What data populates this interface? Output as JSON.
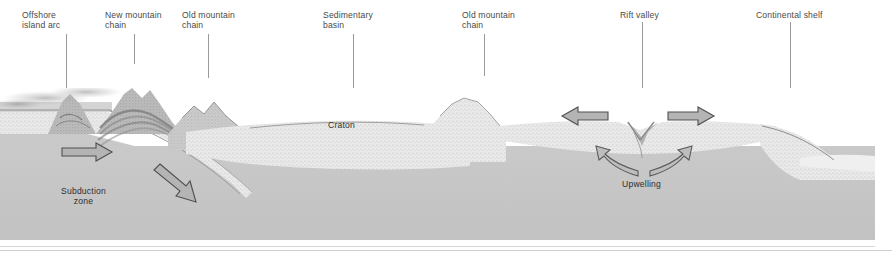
{
  "diagram": {
    "type": "cross-section",
    "colors": {
      "mantle": "#c6c6c6",
      "crust": "#e8e8e8",
      "mountain": "#b8b8b8",
      "ocean": "#d9d9d9",
      "label_text": "#4a4a4a",
      "leader_line": "#9a9a9a",
      "arrow_fill": "#b4b4b4",
      "arrow_stroke": "#4f4f4f"
    }
  },
  "callouts": [
    {
      "id": "offshore-island-arc",
      "line1": "Offshore",
      "line2": "island arc",
      "text_x": 22,
      "text_y": 10,
      "leader_x": 66,
      "leader_y": 34,
      "leader_h": 66
    },
    {
      "id": "new-mountain-chain",
      "line1": "New mountain",
      "line2": "chain",
      "text_x": 105,
      "text_y": 10,
      "leader_x": 134,
      "leader_y": 34,
      "leader_h": 30
    },
    {
      "id": "old-mountain-chain-left",
      "line1": "Old mountain",
      "line2": "chain",
      "text_x": 182,
      "text_y": 10,
      "leader_x": 208,
      "leader_y": 34,
      "leader_h": 44
    },
    {
      "id": "sedimentary-basin",
      "line1": "Sedimentary",
      "line2": "basin",
      "text_x": 323,
      "text_y": 10,
      "leader_x": 353,
      "leader_y": 34,
      "leader_h": 64
    },
    {
      "id": "old-mountain-chain-right",
      "line1": "Old mountain",
      "line2": "chain",
      "text_x": 462,
      "text_y": 10,
      "leader_x": 484,
      "leader_y": 34,
      "leader_h": 42
    },
    {
      "id": "rift-valley",
      "line1": "Rift valley",
      "line2": "",
      "text_x": 620,
      "text_y": 10,
      "leader_x": 642,
      "leader_y": 22,
      "leader_h": 76
    },
    {
      "id": "continental-shelf",
      "line1": "Continental shelf",
      "line2": "",
      "text_x": 756,
      "text_y": 10,
      "leader_x": 790,
      "leader_y": 22,
      "leader_h": 76
    }
  ],
  "inline_labels": [
    {
      "id": "subduction-zone",
      "line1": "Subduction",
      "line2": "zone",
      "x": 61,
      "y": 186
    },
    {
      "id": "craton",
      "line1": "Craton",
      "line2": "",
      "x": 328,
      "y": 120
    },
    {
      "id": "upwelling",
      "line1": "Upwelling",
      "line2": "",
      "x": 622,
      "y": 179
    }
  ],
  "arrows": [
    {
      "id": "arrow-plate-convergence",
      "direction": "right-horizontal",
      "meaning": "oceanic plate moving toward trench"
    },
    {
      "id": "arrow-subducting-slab",
      "direction": "down-right-diagonal",
      "meaning": "slab descending into mantle"
    },
    {
      "id": "arrow-rift-left",
      "direction": "left-horizontal",
      "meaning": "plate diverging westward"
    },
    {
      "id": "arrow-rift-right",
      "direction": "right-horizontal",
      "meaning": "plate diverging eastward"
    },
    {
      "id": "arrow-upwelling-left",
      "direction": "curved-up-left",
      "meaning": "mantle upwelling limb"
    },
    {
      "id": "arrow-upwelling-right",
      "direction": "curved-up-right",
      "meaning": "mantle upwelling limb"
    }
  ]
}
